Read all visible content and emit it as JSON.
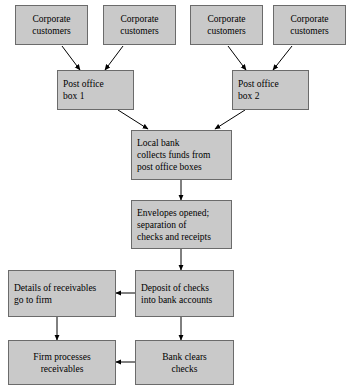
{
  "diagram": {
    "background_color": "#ffffff",
    "box_fill_color": "#c9c9c9",
    "box_border_color": "#6b6b6b",
    "line_color": "#000000",
    "nodes": [
      {
        "id": "cust1",
        "line1": "Corporate",
        "line2": "customers"
      },
      {
        "id": "cust2",
        "line1": "Corporate",
        "line2": "customers"
      },
      {
        "id": "cust3",
        "line1": "Corporate",
        "line2": "customers"
      },
      {
        "id": "cust4",
        "line1": "Corporate",
        "line2": "customers"
      },
      {
        "id": "pobox1",
        "line1": "Post office",
        "line2": "box 1"
      },
      {
        "id": "pobox2",
        "line1": "Post office",
        "line2": "box 2"
      },
      {
        "id": "localbank",
        "line1": "Local bank",
        "line2": "collects funds from",
        "line3": "post office boxes"
      },
      {
        "id": "envelopes",
        "line1": "Envelopes opened;",
        "line2": "separation of",
        "line3": "checks and receipts"
      },
      {
        "id": "details",
        "line1": "Details of receivables",
        "line2": "go to firm"
      },
      {
        "id": "deposit",
        "line1": "Deposit of checks",
        "line2": "into bank accounts"
      },
      {
        "id": "firm",
        "line1": "Firm processes",
        "line2": "receivables"
      },
      {
        "id": "bank",
        "line1": "Bank clears",
        "line2": "checks"
      }
    ],
    "edges": [
      {
        "from": "cust1",
        "to": "pobox1",
        "style": "diagonal"
      },
      {
        "from": "cust2",
        "to": "pobox1",
        "style": "diagonal"
      },
      {
        "from": "cust3",
        "to": "pobox2",
        "style": "diagonal"
      },
      {
        "from": "cust4",
        "to": "pobox2",
        "style": "diagonal"
      },
      {
        "from": "pobox1",
        "to": "localbank",
        "style": "diagonal"
      },
      {
        "from": "pobox2",
        "to": "localbank",
        "style": "diagonal"
      },
      {
        "from": "localbank",
        "to": "envelopes",
        "style": "vertical"
      },
      {
        "from": "envelopes",
        "to": "deposit",
        "style": "vertical"
      },
      {
        "from": "deposit",
        "to": "details",
        "style": "horizontal-left"
      },
      {
        "from": "deposit",
        "to": "bank",
        "style": "vertical"
      },
      {
        "from": "details",
        "to": "firm",
        "style": "vertical"
      },
      {
        "from": "bank",
        "to": "firm",
        "style": "horizontal-left"
      }
    ]
  }
}
